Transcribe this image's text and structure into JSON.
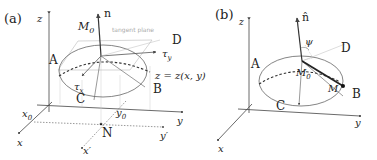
{
  "panel_a": {
    "tag": "(a)",
    "axis_z": "z",
    "axis_x": "x",
    "axis_y": "y",
    "axis_xp": "x′",
    "axis_yp": "y′",
    "point_M0": "M",
    "point_M0_sub": "0",
    "normal": "n",
    "tangent_plane": "tangent plane",
    "tau_y": "τ",
    "tau_y_sub": "y",
    "tau_x": "τ",
    "tau_x_sub": "x",
    "A": "A",
    "B": "B",
    "C": "C",
    "D": "D",
    "surface": "z = z(x, y)",
    "x0": "x",
    "x0_sub": "0",
    "y0": "y",
    "y0_sub": "0",
    "N": "N"
  },
  "panel_b": {
    "tag": "(b)",
    "axis_z": "z",
    "axis_x": "x",
    "axis_y": "y",
    "normal": "n̂",
    "psi": "ψ",
    "A": "A",
    "B": "B",
    "C": "C",
    "D": "D",
    "point_M0": "M",
    "point_M0_sub": "0",
    "point_M": "M"
  }
}
